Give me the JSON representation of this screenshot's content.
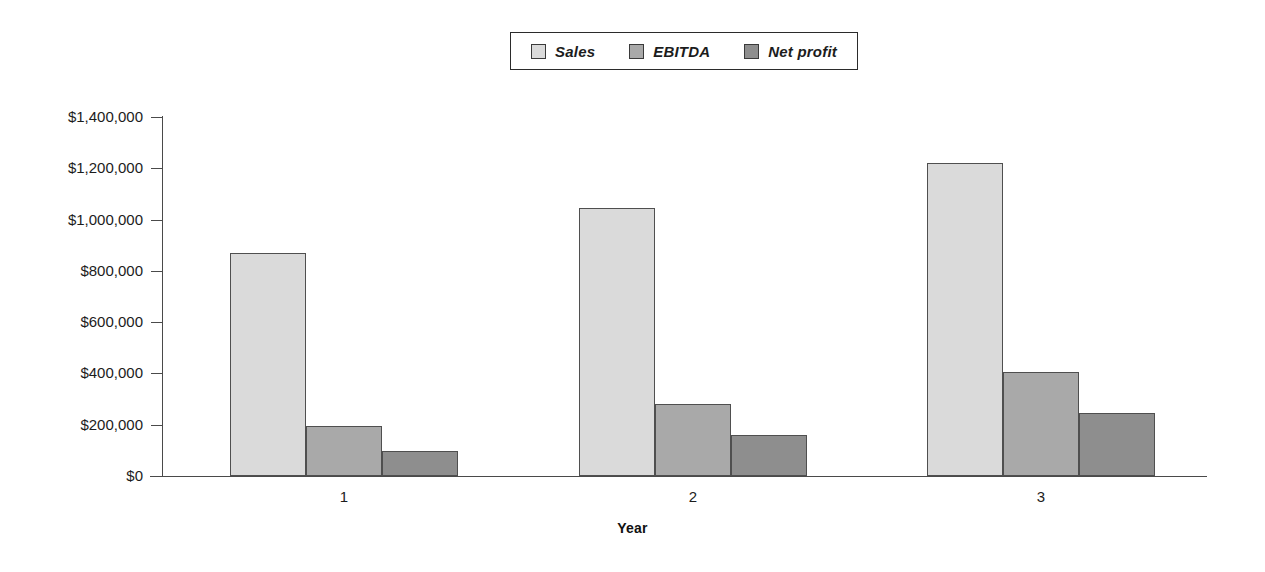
{
  "chart_data": {
    "type": "bar",
    "title": "",
    "subtitle": "",
    "xlabel": "Year",
    "ylabel": "",
    "categories": [
      "1",
      "2",
      "3"
    ],
    "series": [
      {
        "name": "Sales",
        "color": "#dadada",
        "values": [
          869000,
          1045000,
          1220000
        ]
      },
      {
        "name": "EBITDA",
        "color": "#a9a9a9",
        "values": [
          195000,
          280000,
          405000
        ]
      },
      {
        "name": "Net profit",
        "color": "#8e8e8e",
        "values": [
          97000,
          160000,
          245000
        ]
      }
    ],
    "ylim": [
      0,
      1400000
    ],
    "y_ticks": [
      0,
      200000,
      400000,
      600000,
      800000,
      1000000,
      1200000,
      1400000
    ],
    "y_tick_labels": [
      "$0",
      "$200,000",
      "$400,000",
      "$600,000",
      "$800,000",
      "$1,000,000",
      "$1,200,000",
      "$1,400,000"
    ],
    "x_tick_labels": [
      "1",
      "2",
      "3"
    ],
    "grid": false,
    "legend_position": "top-center",
    "legend_entries": [
      "Sales",
      "EBITDA",
      "Net profit"
    ]
  },
  "legend": {
    "items": [
      {
        "label": "Sales",
        "swatch_name": "legend-swatch-sales",
        "color": "#dadada"
      },
      {
        "label": "EBITDA",
        "swatch_name": "legend-swatch-ebitda",
        "color": "#a9a9a9"
      },
      {
        "label": "Net profit",
        "swatch_name": "legend-swatch-net",
        "color": "#8e8e8e"
      }
    ]
  },
  "axes": {
    "x_title": "Year",
    "y_labels": [
      "$1,400,000",
      "$1,200,000",
      "$1,000,000",
      "$800,000",
      "$600,000",
      "$400,000",
      "$200,000",
      "$0"
    ],
    "x_labels": [
      "1",
      "2",
      "3"
    ]
  }
}
